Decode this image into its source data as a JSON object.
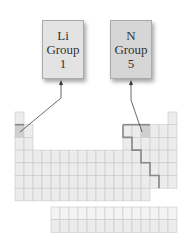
{
  "cards": [
    {
      "symbol": "Li",
      "group_label": "Group",
      "group_number": "1",
      "fill": "#e3e3e3"
    },
    {
      "symbol": "N",
      "group_label": "Group",
      "group_number": "5",
      "fill": "#d6d6d6"
    }
  ],
  "table": {
    "main_rows": 7,
    "columns": 18,
    "f_block_rows": 2,
    "f_block_columns": 14,
    "cell_fill": "#ececec",
    "cell_line": "#c8c8c8",
    "highlight_fill": "#cfcfcf",
    "metal_line": "#888888",
    "highlighted_cells": [
      {
        "name": "Li",
        "row": 2,
        "group": 1
      },
      {
        "name": "N",
        "row": 2,
        "group": 15
      }
    ]
  }
}
